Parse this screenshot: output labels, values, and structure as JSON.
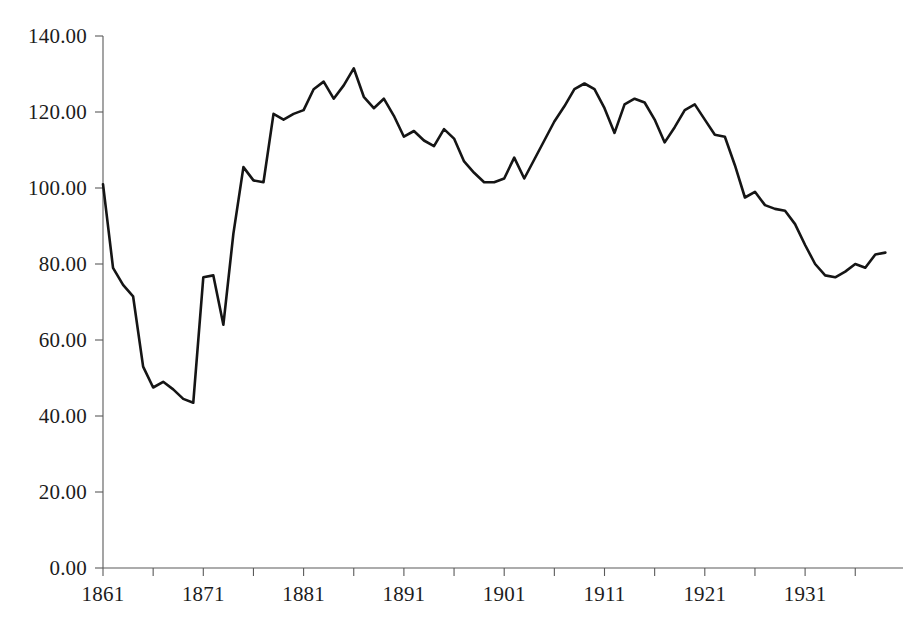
{
  "chart_data": {
    "type": "line",
    "title": "",
    "subtitle": "",
    "xlabel": "",
    "ylabel": "",
    "xlim": [
      1861,
      1939
    ],
    "ylim": [
      0,
      140
    ],
    "grid": false,
    "legend": false,
    "legend_position": "none",
    "y_ticks": [
      0,
      20,
      40,
      60,
      80,
      100,
      120,
      140
    ],
    "y_tick_labels": [
      "0.00",
      "20.00",
      "40.00",
      "60.00",
      "80.00",
      "100.00",
      "120.00",
      "140.00"
    ],
    "x_ticks": [
      1861,
      1871,
      1881,
      1891,
      1901,
      1911,
      1921,
      1931
    ],
    "x_tick_labels": [
      "1861",
      "1871",
      "1881",
      "1891",
      "1901",
      "1911",
      "1921",
      "1931"
    ],
    "x_minor_tick_interval": 5,
    "line_color": "#151515",
    "axis_color": "#5a5a5a",
    "series": [
      {
        "name": "Index",
        "x": [
          1861,
          1862,
          1863,
          1864,
          1865,
          1866,
          1867,
          1868,
          1869,
          1870,
          1871,
          1872,
          1873,
          1874,
          1875,
          1876,
          1877,
          1878,
          1879,
          1880,
          1881,
          1882,
          1883,
          1884,
          1885,
          1886,
          1887,
          1888,
          1889,
          1890,
          1891,
          1892,
          1893,
          1894,
          1895,
          1896,
          1897,
          1898,
          1899,
          1900,
          1901,
          1902,
          1903,
          1904,
          1905,
          1906,
          1907,
          1908,
          1909,
          1910,
          1911,
          1912,
          1913,
          1914,
          1915,
          1916,
          1917,
          1918,
          1919,
          1920,
          1921,
          1922,
          1923,
          1924,
          1925,
          1926,
          1927,
          1928,
          1929,
          1930,
          1931,
          1932,
          1933,
          1934,
          1935,
          1936,
          1937,
          1938,
          1939
        ],
        "values": [
          101.0,
          79.0,
          74.5,
          71.5,
          53.0,
          47.5,
          49.0,
          47.0,
          44.5,
          43.5,
          76.5,
          77.0,
          64.0,
          88.0,
          105.5,
          102.0,
          101.5,
          119.5,
          118.0,
          119.5,
          120.5,
          126.0,
          128.0,
          123.5,
          127.0,
          131.5,
          124.0,
          121.0,
          123.5,
          119.0,
          113.5,
          115.0,
          112.5,
          111.0,
          115.5,
          113.0,
          107.0,
          104.0,
          101.5,
          101.5,
          102.5,
          108.0,
          102.5,
          107.5,
          112.5,
          117.5,
          121.5,
          126.0,
          127.5,
          126.0,
          121.0,
          114.5,
          122.0,
          123.5,
          122.5,
          118.0,
          112.0,
          116.0,
          120.5,
          122.0,
          118.0,
          114.0,
          113.5,
          106.0,
          97.5,
          99.0,
          95.5,
          94.5,
          94.0,
          90.5,
          85.0,
          80.0,
          77.0,
          76.5,
          78.0,
          80.0,
          79.0,
          82.5,
          83.0
        ]
      }
    ]
  },
  "axes": {
    "y_axis_name": "value-axis",
    "x_axis_name": "year-axis"
  }
}
